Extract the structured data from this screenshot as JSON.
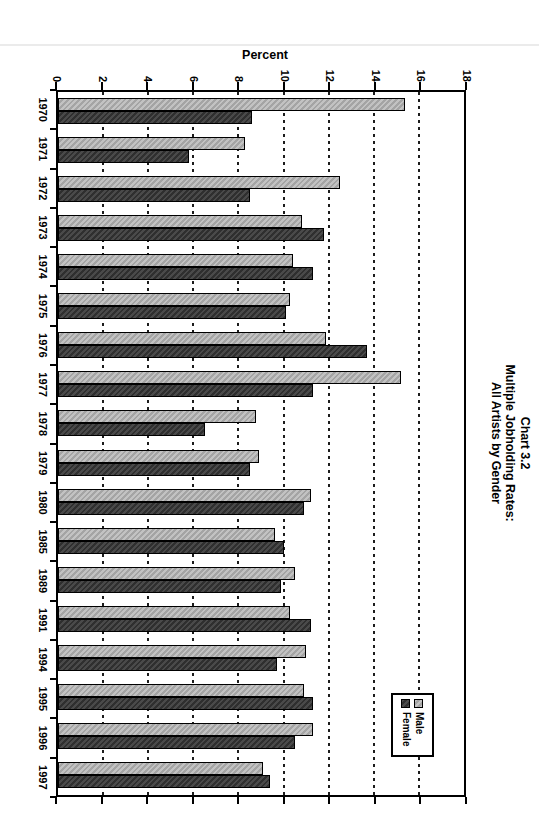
{
  "page": {
    "background": "#ffffff"
  },
  "chart_data": {
    "type": "bar",
    "title_lines": [
      "Chart 3.2",
      "Multiple Jobholding Rates:",
      "All Artists by Gender"
    ],
    "ylabel": "Percent",
    "ylim": [
      0,
      18
    ],
    "ytick_step": 2,
    "yticks": [
      0,
      2,
      4,
      6,
      8,
      10,
      12,
      14,
      16,
      18
    ],
    "grid": "dashed lines at every 2 percent",
    "legend_position": "inside plot, right",
    "categories": [
      "1970",
      "1971",
      "1972",
      "1973",
      "1974",
      "1975",
      "1976",
      "1977",
      "1978",
      "1979",
      "1980",
      "1985",
      "1989",
      "1991",
      "1994",
      "1995",
      "1996",
      "1997"
    ],
    "series": [
      {
        "name": "Male",
        "color": "#b3b3b3",
        "values": [
          15.4,
          8.3,
          12.5,
          10.8,
          10.4,
          10.3,
          11.9,
          15.2,
          8.8,
          8.9,
          11.2,
          9.6,
          10.5,
          10.3,
          11.0,
          10.9,
          11.3,
          9.1
        ]
      },
      {
        "name": "Female",
        "color": "#3d3d3d",
        "values": [
          8.6,
          5.8,
          8.5,
          11.8,
          11.3,
          10.1,
          13.7,
          11.3,
          6.5,
          8.5,
          10.9,
          10.0,
          9.9,
          11.2,
          9.7,
          11.3,
          10.5,
          9.4
        ]
      }
    ]
  }
}
